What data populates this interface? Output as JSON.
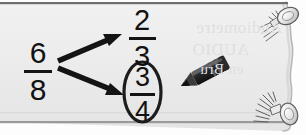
{
  "scene": {
    "title": "Handwritten fraction simplification note on torn paper",
    "paper_color": "#ececec",
    "paper_shadow_color": "#c9c9c9",
    "ink_color": "#141414",
    "ghost_text_color": "#dfdfe1",
    "top_rule_color": "#6e6e6e"
  },
  "math": {
    "source_fraction": {
      "label": "six eighths",
      "numerator": "6",
      "denominator": "8"
    },
    "choices": [
      {
        "label": "two thirds",
        "numerator": "2",
        "denominator": "3",
        "circled": false
      },
      {
        "label": "three quarters",
        "numerator": "3",
        "denominator": "4",
        "circled": true
      }
    ],
    "arrows": [
      {
        "name": "arrow-to-two-thirds",
        "from": "6/8",
        "to": "2/3"
      },
      {
        "name": "arrow-to-three-quarters",
        "from": "6/8",
        "to": "3/4"
      }
    ]
  },
  "annotations": {
    "pencil": {
      "label": "pencil",
      "points_at": "3/4"
    },
    "pushpins": [
      {
        "label": "top-right pushpin"
      },
      {
        "label": "bottom-right pushpin"
      }
    ],
    "circle": {
      "label": "selection oval around 3/4"
    }
  },
  "ghost_text": {
    "line_1": "Audiometre",
    "line_2": "AUDIO",
    "line_3": "en Bru"
  }
}
